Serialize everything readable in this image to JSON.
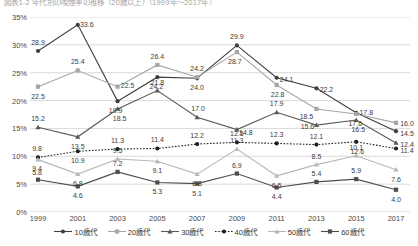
{
  "title": "図表1-2 年代別の喫煙率の推移（20歳以上）（1999年～2017年）",
  "chart_data": {
    "type": "line",
    "title": "図表1-2 年代別の喫煙率の推移（20歳以上）（1999年～2017年）",
    "xlabel": "",
    "ylabel": "",
    "ylim": [
      0,
      35
    ],
    "yticks": [
      "0%",
      "5%",
      "10%",
      "15%",
      "20%",
      "25%",
      "30%",
      "35%"
    ],
    "ytick_values": [
      0,
      5,
      10,
      15,
      20,
      25,
      30,
      35
    ],
    "grid": true,
    "legend_position": "bottom",
    "categories": [
      "1999",
      "2001",
      "2003",
      "2005",
      "2007",
      "2009",
      "2011",
      "2013",
      "2015",
      "2017"
    ],
    "series": [
      {
        "name": "10歳代",
        "color": "#3f3f3f",
        "marker": "circle",
        "dash": "solid",
        "values": [
          28.9,
          33.6,
          19.9,
          24.2,
          24.0,
          29.9,
          24.1,
          22.2,
          17.8,
          14.5
        ]
      },
      {
        "name": "20歳代",
        "color": "#a6a6a6",
        "marker": "square",
        "dash": "solid",
        "values": [
          22.5,
          25.4,
          22.5,
          26.4,
          24.2,
          28.7,
          22.8,
          18.5,
          17.6,
          16.0
        ]
      },
      {
        "name": "30歳代",
        "color": "#5a5a5a",
        "marker": "triangle",
        "dash": "solid",
        "values": [
          15.2,
          13.5,
          18.5,
          21.8,
          17.0,
          14.8,
          17.9,
          15.6,
          16.5,
          12.4
        ]
      },
      {
        "name": "40歳代",
        "color": "#1f1f1f",
        "marker": "circle",
        "dash": "dotted",
        "values": [
          9.8,
          10.9,
          11.3,
          11.4,
          12.2,
          12.5,
          12.3,
          12.1,
          12.6,
          11.4
        ]
      },
      {
        "name": "50歳代",
        "color": "#b8b8b8",
        "marker": "triangle",
        "dash": "solid",
        "values": [
          9.4,
          6.8,
          9.5,
          9.1,
          6.8,
          11.3,
          6.5,
          8.5,
          10.1,
          7.6
        ]
      },
      {
        "name": "60歳代",
        "color": "#4d4d4d",
        "marker": "square",
        "dash": "solid",
        "values": [
          5.8,
          4.6,
          7.2,
          5.3,
          5.1,
          6.9,
          4.4,
          5.4,
          5.9,
          4.0
        ]
      }
    ],
    "label_offsets": {
      "10歳代": [
        [
          0,
          -9
        ],
        [
          9,
          -1
        ],
        [
          -2,
          9
        ],
        [
          -1,
          9
        ],
        [
          0,
          9
        ],
        [
          0,
          -9
        ],
        [
          10,
          1
        ],
        [
          10,
          1
        ],
        [
          10,
          -1
        ],
        [
          11,
          2
        ]
      ],
      "20歳代": [
        [
          0,
          9
        ],
        [
          0,
          -9
        ],
        [
          10,
          -2
        ],
        [
          0,
          -9
        ],
        [
          0,
          -9
        ],
        [
          -2,
          9
        ],
        [
          1,
          9
        ],
        [
          -10,
          7
        ],
        [
          -1,
          9
        ],
        [
          11,
          0
        ]
      ],
      "30歳代": [
        [
          0,
          -9
        ],
        [
          0,
          9
        ],
        [
          2,
          9
        ],
        [
          0,
          -9
        ],
        [
          1,
          -9
        ],
        [
          9,
          2
        ],
        [
          0,
          -9
        ],
        [
          -9,
          1
        ],
        [
          2,
          9
        ],
        [
          11,
          1
        ]
      ],
      "40歳代": [
        [
          -1,
          -9
        ],
        [
          0,
          9
        ],
        [
          0,
          -9
        ],
        [
          0,
          -9
        ],
        [
          0,
          -9
        ],
        [
          0,
          -9
        ],
        [
          0,
          -9
        ],
        [
          0,
          -9
        ],
        [
          1,
          9
        ],
        [
          11,
          2
        ]
      ],
      "50歳代": [
        [
          -1,
          8
        ],
        [
          0,
          9
        ],
        [
          0,
          -9
        ],
        [
          0,
          9
        ],
        [
          0,
          9
        ],
        [
          0,
          -9
        ],
        [
          0,
          9
        ],
        [
          0,
          -9
        ],
        [
          0,
          -9
        ],
        [
          0,
          9
        ]
      ],
      "60歳代": [
        [
          -1,
          -8
        ],
        [
          0,
          9
        ],
        [
          0,
          -9
        ],
        [
          0,
          9
        ],
        [
          0,
          9
        ],
        [
          0,
          -9
        ],
        [
          0,
          9
        ],
        [
          0,
          -9
        ],
        [
          0,
          -9
        ],
        [
          0,
          9
        ]
      ]
    }
  }
}
